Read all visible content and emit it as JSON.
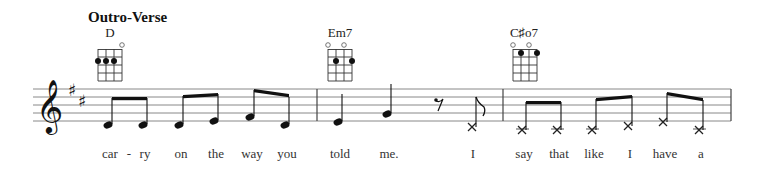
{
  "section": {
    "title": "Outro-Verse"
  },
  "chords": [
    {
      "name": "D",
      "x": 110,
      "open_strings": [
        4
      ],
      "dots": [
        {
          "string": 1,
          "fret": 2
        },
        {
          "string": 2,
          "fret": 2
        },
        {
          "string": 3,
          "fret": 2
        }
      ]
    },
    {
      "name": "Em7",
      "x": 340,
      "open_strings": [
        1,
        3
      ],
      "dots": [
        {
          "string": 2,
          "fret": 2
        },
        {
          "string": 4,
          "fret": 2
        }
      ]
    },
    {
      "name": "C♯o7",
      "x": 524,
      "open_strings": [
        1,
        3
      ],
      "dots": [
        {
          "string": 2,
          "fret": 1
        },
        {
          "string": 4,
          "fret": 1
        }
      ]
    }
  ],
  "staff": {
    "clef": "treble",
    "key_signature": "D major (2 sharps)",
    "measures": 3
  },
  "notes": [
    {
      "measure": 1,
      "pitch": "D4",
      "duration": "eighth",
      "lyric": "car"
    },
    {
      "measure": 1,
      "pitch": "D4",
      "duration": "eighth",
      "lyric": "ry"
    },
    {
      "measure": 1,
      "pitch": "D4",
      "duration": "eighth",
      "lyric": "on"
    },
    {
      "measure": 1,
      "pitch": "E4",
      "duration": "eighth",
      "lyric": "the"
    },
    {
      "measure": 1,
      "pitch": "F#4",
      "duration": "eighth",
      "lyric": "way"
    },
    {
      "measure": 1,
      "pitch": "D4",
      "duration": "eighth",
      "lyric": "you"
    },
    {
      "measure": 2,
      "pitch": "E4",
      "duration": "quarter",
      "lyric": "told"
    },
    {
      "measure": 2,
      "pitch": "G4",
      "duration": "quarter",
      "lyric": "me."
    },
    {
      "measure": 2,
      "pitch": "rest",
      "duration": "eighth",
      "lyric": ""
    },
    {
      "measure": 2,
      "pitch": "x",
      "duration": "eighth",
      "lyric": "I"
    },
    {
      "measure": 3,
      "pitch": "x",
      "duration": "eighth",
      "lyric": "say"
    },
    {
      "measure": 3,
      "pitch": "x",
      "duration": "eighth",
      "lyric": "that"
    },
    {
      "measure": 3,
      "pitch": "x",
      "duration": "eighth",
      "lyric": "like"
    },
    {
      "measure": 3,
      "pitch": "x",
      "duration": "eighth",
      "lyric": "I"
    },
    {
      "measure": 3,
      "pitch": "x",
      "duration": "eighth",
      "lyric": "have"
    },
    {
      "measure": 3,
      "pitch": "x",
      "duration": "eighth",
      "lyric": "a"
    }
  ],
  "lyrics": {
    "hyphen": "-",
    "words": [
      "car",
      "ry",
      "on",
      "the",
      "way",
      "you",
      "told",
      "me.",
      "I",
      "say",
      "that",
      "like",
      "I",
      "have",
      "a"
    ]
  }
}
